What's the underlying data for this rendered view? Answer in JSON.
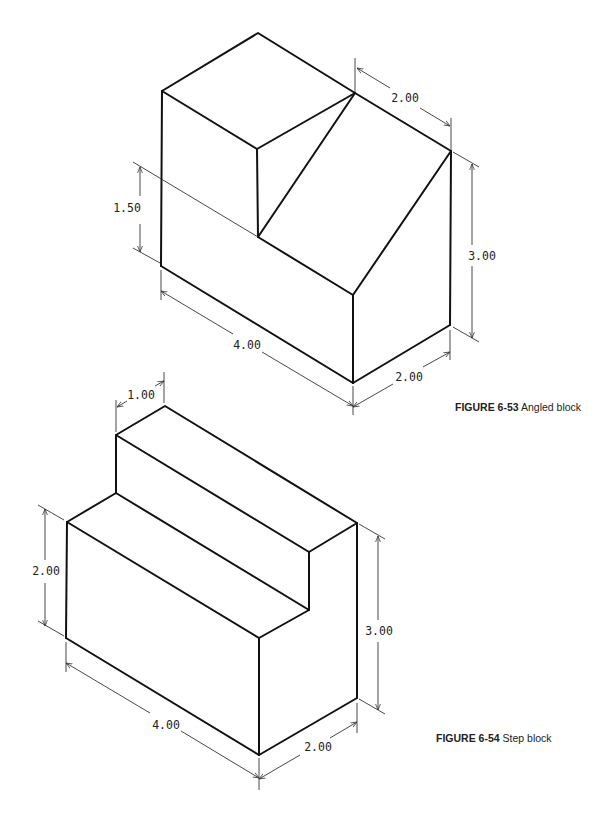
{
  "figures": [
    {
      "id": "6-53",
      "caption_label": "FIGURE 6-53",
      "caption_title": "Angled block",
      "dimensions": {
        "top_depth": "2.00",
        "left_height": "1.50",
        "right_height": "3.00",
        "length": "4.00",
        "bottom_depth": "2.00"
      }
    },
    {
      "id": "6-54",
      "caption_label": "FIGURE 6-54",
      "caption_title": "Step block",
      "dimensions": {
        "step_width": "1.00",
        "left_height": "2.00",
        "right_height": "3.00",
        "length": "4.00",
        "bottom_depth": "2.00"
      }
    }
  ]
}
